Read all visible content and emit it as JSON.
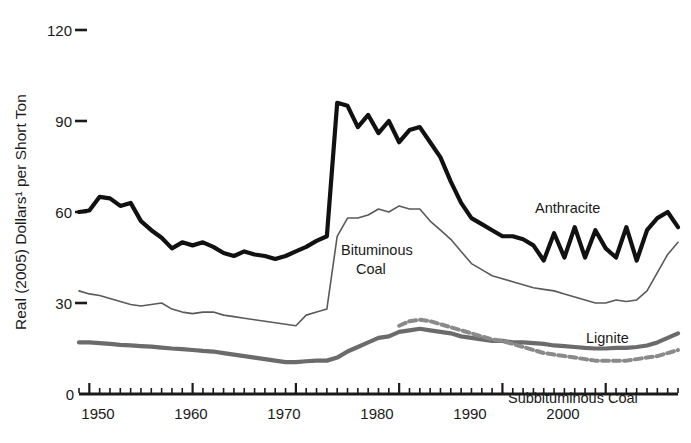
{
  "chart_data": {
    "type": "line",
    "title": "",
    "xlabel": "",
    "ylabel": "Real (2005) Dollars¹ per Short Ton",
    "xlim": [
      1949,
      2007
    ],
    "ylim": [
      0,
      120
    ],
    "grid": false,
    "legend_position": "inline-annotations",
    "xticks": [
      1950,
      1960,
      1970,
      1980,
      1990,
      2000
    ],
    "xtick_labels": [
      "1950",
      "1960",
      "1970",
      "1980",
      "1990",
      "2000"
    ],
    "yticks": [
      0,
      30,
      60,
      90,
      120
    ],
    "ytick_labels": [
      "0",
      "30",
      "60",
      "90",
      "120"
    ],
    "minor_tick_interval": 1,
    "x": [
      1949,
      1950,
      1951,
      1952,
      1953,
      1954,
      1955,
      1956,
      1957,
      1958,
      1959,
      1960,
      1961,
      1962,
      1963,
      1964,
      1965,
      1966,
      1967,
      1968,
      1969,
      1970,
      1971,
      1972,
      1973,
      1974,
      1975,
      1976,
      1977,
      1978,
      1979,
      1980,
      1981,
      1982,
      1983,
      1984,
      1985,
      1986,
      1987,
      1988,
      1989,
      1990,
      1991,
      1992,
      1993,
      1994,
      1995,
      1996,
      1997,
      1998,
      1999,
      2000,
      2001,
      2002,
      2003,
      2004,
      2005,
      2006,
      2007
    ],
    "series": [
      {
        "name": "Anthracite",
        "color": "#111111",
        "style": "solid",
        "width": 4.2,
        "label_x": 2000,
        "label_y": 66,
        "values": [
          60,
          60.5,
          65,
          64.5,
          62,
          63,
          57,
          54,
          51.5,
          48,
          50,
          49,
          50,
          48.5,
          46.5,
          45.5,
          47,
          46,
          45.5,
          44.5,
          45.5,
          47,
          48.5,
          50.5,
          52,
          96,
          95,
          88,
          92,
          86,
          90,
          83,
          87,
          88,
          83,
          78,
          70,
          63,
          58,
          56,
          54,
          52,
          52,
          51,
          49,
          44,
          53,
          45,
          55,
          45,
          54,
          48,
          45,
          55,
          44,
          54,
          58,
          60,
          55
        ]
      },
      {
        "name": "Bituminous Coal",
        "color": "#5a5a5a",
        "style": "solid",
        "width": 1.6,
        "label_x": 1974,
        "label_y": 44,
        "values": [
          34,
          33,
          32.5,
          31.5,
          30.5,
          29.5,
          29,
          29.5,
          30,
          28,
          27,
          26.5,
          27,
          27,
          26,
          25.5,
          25,
          24.5,
          24,
          23.5,
          23,
          22.5,
          26,
          27,
          28,
          52,
          58,
          58,
          59,
          61,
          60,
          62,
          61,
          61,
          57,
          54,
          51,
          47,
          43,
          41,
          39,
          38,
          37,
          36,
          35,
          34.5,
          34,
          33,
          32,
          31,
          30,
          30,
          31,
          30.5,
          31,
          34,
          40,
          46,
          50
        ]
      },
      {
        "name": "Lignite",
        "color": "#6b6b6b",
        "style": "solid",
        "width": 4.2,
        "label_x": 2000,
        "label_y": 24,
        "values": [
          17,
          17,
          16.8,
          16.5,
          16.2,
          16,
          15.8,
          15.6,
          15.3,
          15,
          14.8,
          14.5,
          14.2,
          14,
          13.5,
          13,
          12.5,
          12,
          11.5,
          11,
          10.5,
          10.5,
          10.8,
          11,
          11,
          12,
          14,
          15.5,
          17,
          18.5,
          19,
          20.5,
          21,
          21.5,
          21,
          20.5,
          20,
          19,
          18.5,
          18,
          17.5,
          17.5,
          17,
          17,
          16.8,
          16.5,
          16,
          15.8,
          15.5,
          15.2,
          15,
          15,
          15.2,
          15.2,
          15.5,
          16,
          17,
          18.5,
          20
        ]
      },
      {
        "name": "Subbituminous Coal",
        "color": "#8a8a8a",
        "style": "dashed",
        "width": 4.0,
        "label_x": 1999,
        "label_y": 6,
        "start_year": 1980,
        "values": [
          null,
          null,
          null,
          null,
          null,
          null,
          null,
          null,
          null,
          null,
          null,
          null,
          null,
          null,
          null,
          null,
          null,
          null,
          null,
          null,
          null,
          null,
          null,
          null,
          null,
          null,
          null,
          null,
          null,
          null,
          null,
          22.5,
          24,
          24.5,
          24,
          23,
          22,
          21,
          20,
          19,
          18,
          17.5,
          16.5,
          15.5,
          14.5,
          13.5,
          13,
          12.5,
          12,
          11.5,
          11,
          11,
          11,
          11,
          11.5,
          12,
          12.5,
          13.5,
          14.5
        ]
      }
    ],
    "annotations": [
      {
        "text": "Anthracite",
        "x_px": 535,
        "y_px": 213
      },
      {
        "text": "Bituminous",
        "x_px": 341,
        "y_px": 255
      },
      {
        "text": "Coal",
        "x_px": 368,
        "y_px": 274
      },
      {
        "text": "Lignite",
        "x_px": 586,
        "y_px": 343
      },
      {
        "text": "Subbituminous Coal",
        "x_px": 508,
        "y_px": 403
      }
    ]
  },
  "axis": {
    "y_title": "Real (2005) Dollars¹ per Short Ton",
    "y_ticks": [
      "120",
      "90",
      "60",
      "30",
      "0"
    ],
    "x_ticks": [
      "1950",
      "1960",
      "1970",
      "1980",
      "1990",
      "2000"
    ]
  },
  "labels": {
    "anthracite": "Anthracite",
    "bituminous_line1": "Bituminous",
    "bituminous_line2": "Coal",
    "lignite": "Lignite",
    "subbituminous": "Subbituminous Coal"
  },
  "colors": {
    "anthracite": "#111111",
    "bituminous": "#5a5a5a",
    "lignite": "#6b6b6b",
    "subbituminous": "#8a8a8a",
    "axis": "#1a1a1a",
    "background": "#ffffff"
  }
}
